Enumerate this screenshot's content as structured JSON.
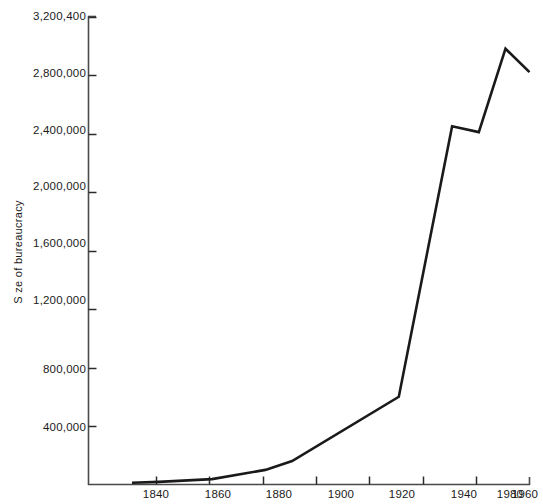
{
  "chart_data": {
    "type": "line",
    "title": "",
    "xlabel": "",
    "ylabel": "S ze of bureaucracy",
    "xlim": [
      1831,
      1980
    ],
    "ylim": [
      0,
      3200400
    ],
    "grid": false,
    "legend": false,
    "x_ticks": [
      "1840",
      "1860",
      "1880",
      "1900",
      "1920",
      "1940",
      "1960",
      "1980"
    ],
    "x_tick_values": [
      1840,
      1860,
      1880,
      1900,
      1920,
      1940,
      1960,
      1980
    ],
    "y_ticks": [
      "400,000",
      "800,000",
      "1,200,000",
      "1,600,000",
      "2,000,000",
      "2,400,000",
      "2,800,000",
      "3,200,400"
    ],
    "y_tick_values": [
      400000,
      800000,
      1200000,
      1600000,
      2000000,
      2400000,
      2800000,
      3200400
    ],
    "series": [
      {
        "name": "Size of bureaucracy",
        "color": "#1a1a1a",
        "x": [
          1831,
          1841,
          1861,
          1881,
          1891,
          1931,
          1951,
          1961,
          1971,
          1980
        ],
        "values": [
          11700,
          18000,
          37000,
          100000,
          160000,
          600000,
          2450000,
          2410000,
          2980000,
          2820000
        ]
      }
    ]
  },
  "axis": {
    "line_color": "#4a4a4a",
    "tick_color": "#2b2b2b"
  }
}
